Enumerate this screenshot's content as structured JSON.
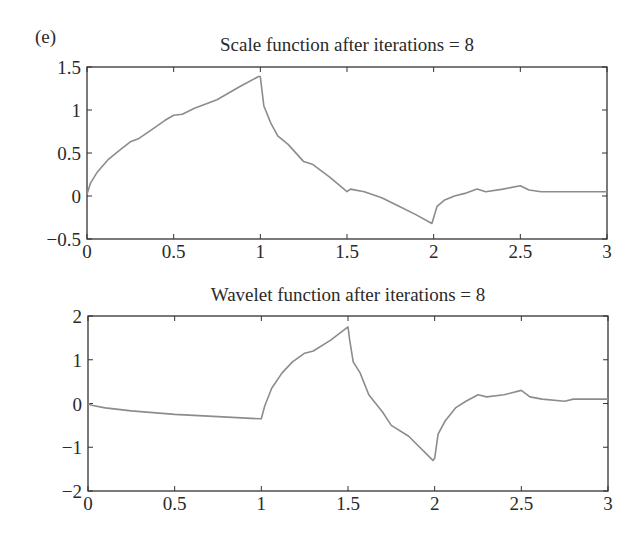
{
  "figure": {
    "panel_label": "(e)",
    "line_color": "#8c8c8c",
    "axis_color": "#333333"
  },
  "chart_data": [
    {
      "type": "line",
      "title": "Scale function after iterations = 8",
      "xlabel": "",
      "ylabel": "",
      "xlim": [
        0,
        3
      ],
      "ylim": [
        -0.5,
        1.5
      ],
      "xticks": [
        0,
        0.5,
        1,
        1.5,
        2,
        2.5,
        3
      ],
      "xtick_labels": [
        "0",
        "0.5",
        "1",
        "1.5",
        "2",
        "2.5",
        "3"
      ],
      "yticks": [
        -0.5,
        0,
        0.5,
        1,
        1.5
      ],
      "ytick_labels": [
        "−0.5",
        "0",
        "0.5",
        "1",
        "1.5"
      ],
      "grid": false,
      "series": [
        {
          "name": "scale function",
          "x": [
            0,
            0.02,
            0.06,
            0.12,
            0.18,
            0.25,
            0.3,
            0.38,
            0.45,
            0.5,
            0.55,
            0.62,
            0.75,
            0.88,
            0.99,
            1.0,
            1.02,
            1.06,
            1.1,
            1.16,
            1.25,
            1.3,
            1.4,
            1.5,
            1.52,
            1.6,
            1.7,
            1.8,
            1.9,
            1.99,
            2.0,
            2.02,
            2.06,
            2.12,
            2.18,
            2.25,
            2.3,
            2.4,
            2.5,
            2.55,
            2.62,
            2.75,
            2.8,
            3.0
          ],
          "y": [
            0.02,
            0.15,
            0.28,
            0.42,
            0.52,
            0.63,
            0.67,
            0.78,
            0.88,
            0.94,
            0.95,
            1.02,
            1.12,
            1.27,
            1.39,
            1.39,
            1.05,
            0.85,
            0.7,
            0.6,
            0.4,
            0.37,
            0.22,
            0.05,
            0.08,
            0.05,
            -0.02,
            -0.12,
            -0.22,
            -0.32,
            -0.25,
            -0.12,
            -0.05,
            0.0,
            0.03,
            0.08,
            0.05,
            0.08,
            0.12,
            0.07,
            0.05,
            0.05,
            0.05,
            0.05
          ]
        }
      ]
    },
    {
      "type": "line",
      "title": "Wavelet function after iterations = 8",
      "xlabel": "",
      "ylabel": "",
      "xlim": [
        0,
        3
      ],
      "ylim": [
        -2,
        2
      ],
      "xticks": [
        0,
        0.5,
        1,
        1.5,
        2,
        2.5,
        3
      ],
      "xtick_labels": [
        "0",
        "0.5",
        "1",
        "1.5",
        "2",
        "2.5",
        "3"
      ],
      "yticks": [
        -2,
        -1,
        0,
        1,
        2
      ],
      "ytick_labels": [
        "−2",
        "−1",
        "0",
        "1",
        "2"
      ],
      "grid": false,
      "series": [
        {
          "name": "wavelet function",
          "x": [
            0,
            0.02,
            0.1,
            0.25,
            0.5,
            0.75,
            0.99,
            1.0,
            1.02,
            1.06,
            1.12,
            1.18,
            1.25,
            1.3,
            1.4,
            1.5,
            1.51,
            1.53,
            1.57,
            1.62,
            1.7,
            1.75,
            1.85,
            1.99,
            2.0,
            2.02,
            2.06,
            2.12,
            2.18,
            2.25,
            2.3,
            2.4,
            2.5,
            2.55,
            2.62,
            2.75,
            2.8,
            3.0
          ],
          "y": [
            0.0,
            -0.04,
            -0.1,
            -0.17,
            -0.25,
            -0.3,
            -0.35,
            -0.35,
            -0.05,
            0.35,
            0.7,
            0.95,
            1.15,
            1.2,
            1.45,
            1.75,
            1.45,
            0.95,
            0.7,
            0.2,
            -0.2,
            -0.5,
            -0.75,
            -1.3,
            -1.25,
            -0.7,
            -0.4,
            -0.1,
            0.05,
            0.2,
            0.15,
            0.2,
            0.3,
            0.15,
            0.1,
            0.05,
            0.1,
            0.1
          ]
        }
      ]
    }
  ]
}
